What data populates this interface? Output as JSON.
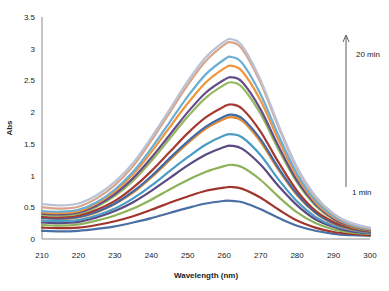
{
  "chart_data": {
    "type": "line",
    "title": "",
    "xlabel": "Wavelength (nm)",
    "ylabel": "Abs",
    "xlim": [
      210,
      300
    ],
    "ylim": [
      0,
      3.5
    ],
    "x_ticks": [
      "210",
      "220",
      "230",
      "240",
      "250",
      "260",
      "270",
      "280",
      "290",
      "300"
    ],
    "y_ticks": [
      "0",
      "0.5",
      "1",
      "1.5",
      "2",
      "2.5",
      "3",
      "3.5"
    ],
    "grid": false,
    "legend": null,
    "annotations": [
      {
        "text": "20 min",
        "position": "top-right",
        "arrow": "upward from 1 min to 20 min"
      },
      {
        "text": "1 min",
        "position": "right-middle"
      }
    ],
    "x": [
      210,
      215,
      220,
      225,
      230,
      235,
      240,
      245,
      250,
      255,
      260,
      262,
      265,
      270,
      275,
      280,
      285,
      290,
      295,
      300
    ],
    "series": [
      {
        "name": "1 min",
        "color": "#4a6fa5",
        "values": [
          0.13,
          0.12,
          0.13,
          0.16,
          0.2,
          0.26,
          0.33,
          0.41,
          0.49,
          0.56,
          0.6,
          0.6,
          0.58,
          0.47,
          0.33,
          0.21,
          0.13,
          0.08,
          0.06,
          0.05
        ]
      },
      {
        "name": "2 min",
        "color": "#a0352e",
        "values": [
          0.18,
          0.17,
          0.18,
          0.22,
          0.28,
          0.36,
          0.46,
          0.57,
          0.67,
          0.76,
          0.81,
          0.82,
          0.79,
          0.65,
          0.46,
          0.29,
          0.18,
          0.11,
          0.08,
          0.06
        ]
      },
      {
        "name": "3 min",
        "color": "#8fb159",
        "values": [
          0.22,
          0.21,
          0.23,
          0.29,
          0.37,
          0.48,
          0.62,
          0.78,
          0.93,
          1.06,
          1.15,
          1.17,
          1.13,
          0.93,
          0.66,
          0.42,
          0.25,
          0.15,
          0.1,
          0.08
        ]
      },
      {
        "name": "4 min",
        "color": "#5b4a82",
        "values": [
          0.26,
          0.25,
          0.27,
          0.34,
          0.44,
          0.58,
          0.76,
          0.96,
          1.16,
          1.33,
          1.45,
          1.47,
          1.42,
          1.17,
          0.83,
          0.53,
          0.31,
          0.19,
          0.12,
          0.09
        ]
      },
      {
        "name": "5 min",
        "color": "#4b9cc4",
        "values": [
          0.29,
          0.28,
          0.3,
          0.37,
          0.48,
          0.64,
          0.84,
          1.07,
          1.29,
          1.49,
          1.63,
          1.65,
          1.6,
          1.32,
          0.93,
          0.59,
          0.35,
          0.21,
          0.14,
          0.1
        ]
      },
      {
        "name": "6 min",
        "color": "#e48a2e",
        "values": [
          0.33,
          0.32,
          0.34,
          0.42,
          0.55,
          0.73,
          0.97,
          1.24,
          1.51,
          1.74,
          1.89,
          1.92,
          1.86,
          1.53,
          1.08,
          0.69,
          0.41,
          0.24,
          0.15,
          0.11
        ]
      },
      {
        "name": "7 min",
        "color": "#3f6aa8",
        "values": [
          0.33,
          0.32,
          0.35,
          0.43,
          0.56,
          0.75,
          0.99,
          1.27,
          1.54,
          1.77,
          1.93,
          1.96,
          1.9,
          1.57,
          1.11,
          0.71,
          0.42,
          0.25,
          0.16,
          0.11
        ]
      },
      {
        "name": "8 min",
        "color": "#a63a30",
        "values": [
          0.35,
          0.34,
          0.37,
          0.46,
          0.6,
          0.81,
          1.07,
          1.37,
          1.67,
          1.92,
          2.09,
          2.12,
          2.05,
          1.69,
          1.2,
          0.76,
          0.45,
          0.27,
          0.17,
          0.12
        ]
      },
      {
        "name": "9 min",
        "color": "#94b85e",
        "values": [
          0.38,
          0.37,
          0.4,
          0.51,
          0.68,
          0.92,
          1.23,
          1.58,
          1.93,
          2.23,
          2.43,
          2.47,
          2.39,
          1.97,
          1.4,
          0.89,
          0.53,
          0.31,
          0.19,
          0.13
        ]
      },
      {
        "name": "10 min",
        "color": "#654d8a",
        "values": [
          0.4,
          0.39,
          0.42,
          0.53,
          0.71,
          0.96,
          1.28,
          1.64,
          2.0,
          2.31,
          2.51,
          2.55,
          2.47,
          2.04,
          1.45,
          0.92,
          0.55,
          0.32,
          0.2,
          0.14
        ]
      },
      {
        "name": "11 min",
        "color": "#f0953a",
        "values": [
          0.42,
          0.41,
          0.44,
          0.56,
          0.75,
          1.02,
          1.37,
          1.76,
          2.14,
          2.47,
          2.69,
          2.73,
          2.64,
          2.18,
          1.55,
          0.98,
          0.58,
          0.34,
          0.21,
          0.15
        ]
      },
      {
        "name": "12 min",
        "color": "#6aaed6",
        "values": [
          0.44,
          0.43,
          0.46,
          0.58,
          0.78,
          1.06,
          1.43,
          1.84,
          2.25,
          2.6,
          2.83,
          2.87,
          2.77,
          2.28,
          1.62,
          1.03,
          0.61,
          0.36,
          0.22,
          0.16
        ]
      },
      {
        "name": "13 min",
        "color": "#d9a58a",
        "values": [
          0.5,
          0.48,
          0.51,
          0.64,
          0.85,
          1.15,
          1.55,
          1.99,
          2.43,
          2.81,
          3.06,
          3.1,
          2.99,
          2.46,
          1.75,
          1.11,
          0.66,
          0.39,
          0.24,
          0.17
        ]
      },
      {
        "name": "14 min",
        "color": "#b9c2d6",
        "values": [
          0.55,
          0.53,
          0.56,
          0.69,
          0.9,
          1.2,
          1.6,
          2.04,
          2.49,
          2.87,
          3.11,
          3.15,
          3.04,
          2.5,
          1.78,
          1.13,
          0.68,
          0.4,
          0.25,
          0.18
        ]
      }
    ]
  },
  "axes": {
    "x_title": "Wavelength (nm)",
    "y_title": "Abs"
  },
  "annotation": {
    "top_label": "20 min",
    "bottom_label": "1 min"
  }
}
